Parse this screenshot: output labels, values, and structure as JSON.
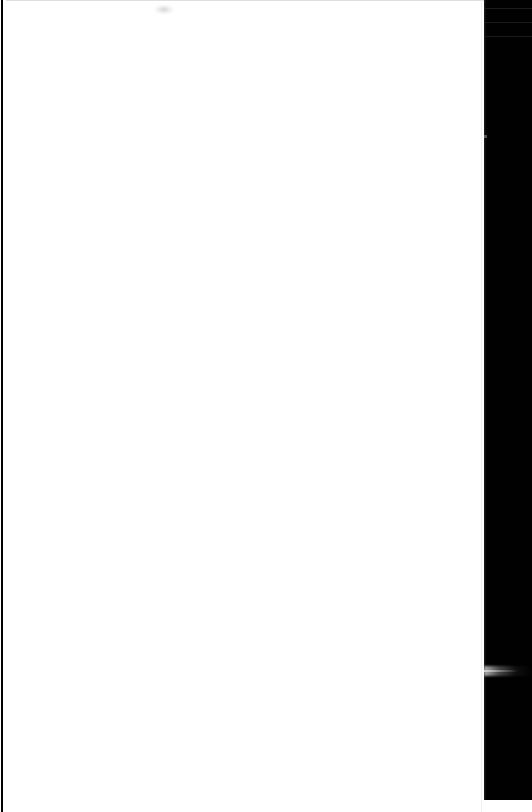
{
  "window": {
    "title": "",
    "width": 532,
    "height": 812
  },
  "content_pane": {
    "name": "blank-document-viewport",
    "state": "blank",
    "body_text": "",
    "background_color": "#ffffff",
    "smudge": {
      "name": "page-smudge",
      "label": "",
      "color": "#aaaaaa"
    },
    "left_edge_rule": {
      "label": "",
      "color": "#000000"
    },
    "top_hairline": {
      "label": "",
      "color": "#d8d8d8"
    }
  },
  "side_panel": {
    "name": "dark-side-panel",
    "label": "",
    "background_color": "#010101",
    "rules": [
      {
        "label": "",
        "color": "#1a1a1a"
      },
      {
        "label": "",
        "color": "#1a1a1a"
      },
      {
        "label": "",
        "color": "#1a1a1a"
      }
    ],
    "highlight_band": {
      "label": "",
      "color": "#b9b9b9"
    },
    "speck": {
      "label": "",
      "color": "#969696"
    }
  }
}
